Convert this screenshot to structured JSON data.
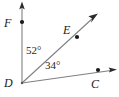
{
  "figure": {
    "type": "geometry-diagram",
    "background_color": "#ffffff",
    "line_color": "#808080",
    "text_color": "#1a1a1a",
    "vertex_label": "D",
    "points": [
      {
        "id": "F",
        "label": "F",
        "x": 22,
        "y": 22,
        "dot": true
      },
      {
        "id": "E",
        "label": "E",
        "x": 77,
        "y": 37,
        "dot": true
      },
      {
        "id": "D",
        "label": "D",
        "x": 22,
        "y": 83,
        "dot": false
      },
      {
        "id": "C",
        "label": "C",
        "x": 98,
        "y": 70,
        "dot": true
      }
    ],
    "rays": [
      {
        "id": "ray-DF",
        "from": "D",
        "through": "F",
        "arrow": true
      },
      {
        "id": "ray-DE",
        "from": "D",
        "through": "E",
        "arrow": true
      },
      {
        "id": "ray-DC",
        "from": "D",
        "through": "C",
        "arrow": true
      }
    ],
    "angles": [
      {
        "id": "angle-FDE",
        "label": "52°",
        "value": 52,
        "unit": "degrees",
        "between": [
          "F",
          "E"
        ],
        "vertex": "D"
      },
      {
        "id": "angle-EDC",
        "label": "34°",
        "value": 34,
        "unit": "degrees",
        "between": [
          "E",
          "C"
        ],
        "vertex": "D"
      }
    ]
  }
}
